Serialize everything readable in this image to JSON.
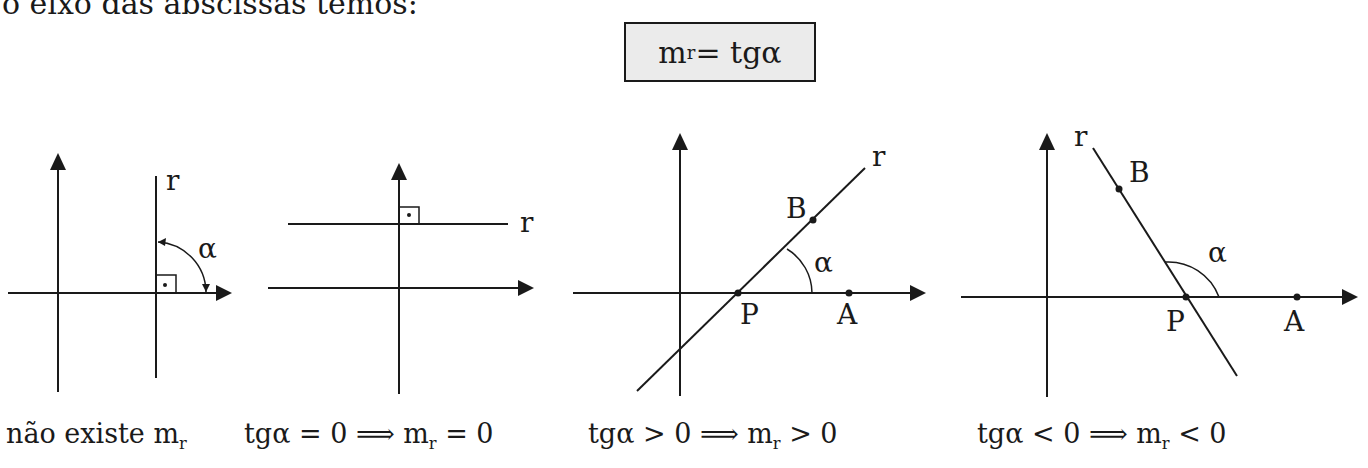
{
  "intro_text": "o eixo das abscissas temos:",
  "formula": {
    "lhs": "m",
    "lhs_sub": "r",
    "rhs": " = tgα"
  },
  "diagrams": [
    {
      "id": "vertical-line",
      "labels": {
        "line": "r",
        "angle": "α"
      },
      "caption": {
        "text": "não existe m",
        "sub": "r",
        "after": ""
      }
    },
    {
      "id": "horizontal-line",
      "labels": {
        "line": "r"
      },
      "caption": {
        "text": "tgα = 0 ⟹ m",
        "sub": "r",
        "after": " = 0"
      }
    },
    {
      "id": "positive-slope",
      "labels": {
        "line": "r",
        "angle": "α",
        "point_b": "B",
        "point_p": "P",
        "point_a": "A"
      },
      "caption": {
        "text": "tgα > 0 ⟹ m",
        "sub": "r",
        "after": " > 0"
      }
    },
    {
      "id": "negative-slope",
      "labels": {
        "line": "r",
        "angle": "α",
        "point_b": "B",
        "point_p": "P",
        "point_a": "A"
      },
      "caption": {
        "text": "tgα < 0 ⟹ m",
        "sub": "r",
        "after": " < 0"
      }
    }
  ],
  "colors": {
    "ink": "#1a1a1a",
    "box_fill": "#ebebeb",
    "background": "#ffffff"
  }
}
